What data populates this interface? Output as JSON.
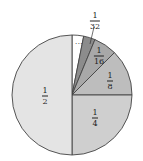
{
  "chart_data": {
    "type": "pie",
    "title": "",
    "center": [
      72,
      95
    ],
    "radius": 60,
    "start_angle_deg": 0,
    "direction": "clockwise",
    "slices": [
      {
        "label": "...",
        "value": 0.03125,
        "fraction": "1/32 (remainder)",
        "color": "#ffffff",
        "label_pos": [
          80,
          43
        ]
      },
      {
        "label": "1/32",
        "num": "1",
        "den": "32",
        "value": 0.03125,
        "color": "#8c8c8c",
        "label_pos": [
          95,
          19
        ]
      },
      {
        "label": "1/16",
        "num": "1",
        "den": "16",
        "value": 0.0625,
        "color": "#a8a8a8",
        "label_pos": [
          99,
          55
        ]
      },
      {
        "label": "1/8",
        "num": "1",
        "den": "8",
        "value": 0.125,
        "color": "#bdbdbd",
        "label_pos": [
          111,
          83
        ]
      },
      {
        "label": "1/4",
        "num": "1",
        "den": "4",
        "value": 0.25,
        "color": "#cfcfcf",
        "label_pos": [
          96,
          118
        ]
      },
      {
        "label": "1/2",
        "num": "1",
        "den": "2",
        "value": 0.5,
        "color": "#e4e4e4",
        "label_pos": [
          45,
          97
        ]
      }
    ],
    "leader_line": {
      "from": [
        94,
        27
      ],
      "to": [
        90,
        44
      ]
    },
    "stroke": "#444444"
  },
  "labels": {
    "remainder": "...",
    "s32_num": "1",
    "s32_den": "32",
    "s16_num": "1",
    "s16_den": "16",
    "s8_num": "1",
    "s8_den": "8",
    "s4_num": "1",
    "s4_den": "4",
    "s2_num": "1",
    "s2_den": "2"
  }
}
